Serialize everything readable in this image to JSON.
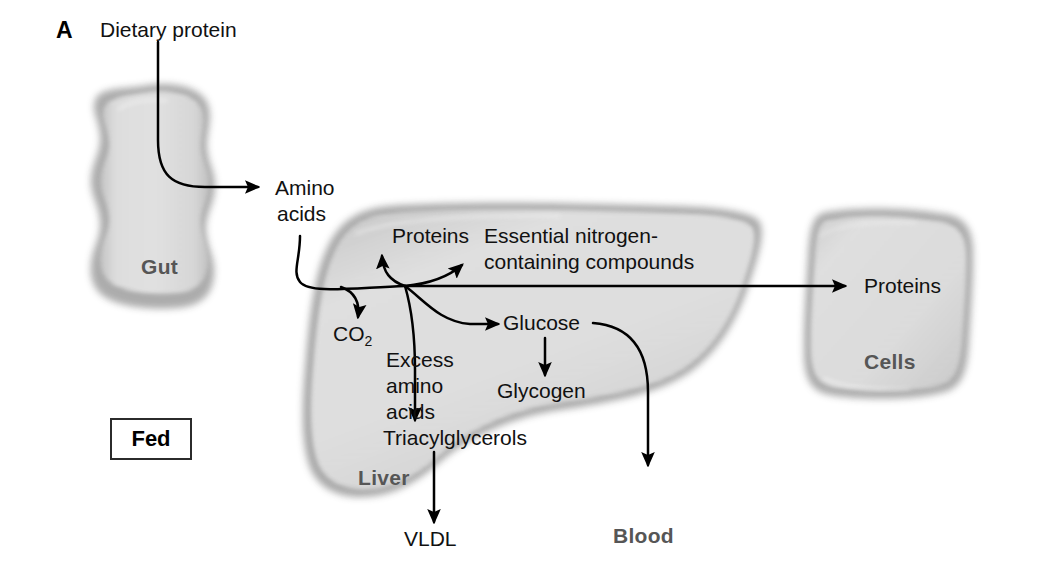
{
  "figure": {
    "panel_letter": "A",
    "state_label": "Fed",
    "background_color": "#ffffff",
    "organ_fill_color": "#d8d8d8",
    "organ_edge_color": "#a6a6a6",
    "organ_label_color": "#565656",
    "arrow_color": "#000000"
  },
  "organs": [
    {
      "key": "gut",
      "label": "Gut"
    },
    {
      "key": "liver",
      "label": "Liver"
    },
    {
      "key": "cells",
      "label": "Cells"
    }
  ],
  "compartments": {
    "blood_label": "Blood"
  },
  "metabolites": {
    "dietary_protein": "Dietary protein",
    "amino_acids_line1": "Amino",
    "amino_acids_line2": "acids",
    "proteins_liver": "Proteins",
    "essential_n_line1": "Essential nitrogen-",
    "essential_n_line2": "containing compounds",
    "co2_main": "CO",
    "co2_subscript": "2",
    "excess_aa_line1": "Excess",
    "excess_aa_line2": "amino",
    "excess_aa_line3": "acids",
    "glucose": "Glucose",
    "glycogen": "Glycogen",
    "triacylglycerols": "Triacylglycerols",
    "vldl": "VLDL",
    "proteins_cells": "Proteins"
  },
  "arrows": [
    {
      "name": "dietary-protein-to-amino-acids",
      "from": "Dietary protein",
      "to": "Amino acids"
    },
    {
      "name": "amino-acids-into-liver",
      "from": "Amino acids",
      "to": "Liver junction"
    },
    {
      "name": "junction-to-co2",
      "from": "Liver junction",
      "to": "CO2"
    },
    {
      "name": "junction-to-proteins",
      "from": "Liver junction",
      "to": "Proteins"
    },
    {
      "name": "junction-to-essential-nitrogen",
      "from": "Liver junction",
      "to": "Essential nitrogen-containing compounds"
    },
    {
      "name": "junction-to-cells-proteins",
      "from": "Liver junction",
      "to": "Proteins (Cells)"
    },
    {
      "name": "junction-to-glucose",
      "from": "Liver junction",
      "to": "Glucose"
    },
    {
      "name": "junction-to-triacylglycerols",
      "from": "Liver junction",
      "to": "Triacylglycerols"
    },
    {
      "name": "glucose-to-glycogen",
      "from": "Glucose",
      "to": "Glycogen"
    },
    {
      "name": "glucose-to-blood",
      "from": "Glucose",
      "to": "Blood"
    },
    {
      "name": "triacylglycerols-to-vldl",
      "from": "Triacylglycerols",
      "to": "VLDL"
    }
  ]
}
